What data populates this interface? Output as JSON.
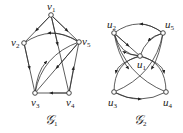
{
  "graphs": [
    {
      "name": "G1",
      "label": "𝒢",
      "label_sub": "1",
      "vertices": [
        {
          "id": "v1",
          "label": "v",
          "sub": "1",
          "x": 51,
          "y": 15
        },
        {
          "id": "v2",
          "label": "v",
          "sub": "2",
          "x": 24,
          "y": 43
        },
        {
          "id": "v5",
          "label": "v",
          "sub": "5",
          "x": 79,
          "y": 42
        },
        {
          "id": "v3",
          "label": "v",
          "sub": "3",
          "x": 35,
          "y": 93
        },
        {
          "id": "v4",
          "label": "v",
          "sub": "4",
          "x": 69,
          "y": 93
        }
      ],
      "edges": [
        {
          "from": "v1",
          "to": "v2"
        },
        {
          "from": "v1",
          "to": "v5"
        },
        {
          "from": "v5",
          "to": "v2"
        },
        {
          "from": "v2",
          "to": "v3"
        },
        {
          "from": "v4",
          "to": "v3"
        },
        {
          "from": "v1",
          "to": "v4"
        },
        {
          "from": "v4",
          "to": "v5"
        },
        {
          "from": "v5",
          "to": "v3"
        },
        {
          "from": "v3",
          "to": "v5"
        }
      ]
    },
    {
      "name": "G2",
      "label": "𝒢",
      "label_sub": "2",
      "vertices": [
        {
          "id": "u2",
          "label": "u",
          "sub": "2",
          "x": 114,
          "y": 33
        },
        {
          "id": "u5",
          "label": "u",
          "sub": "5",
          "x": 163,
          "y": 33
        },
        {
          "id": "u1",
          "label": "u",
          "sub": "1",
          "x": 140,
          "y": 56
        },
        {
          "id": "u3",
          "label": "u",
          "sub": "3",
          "x": 114,
          "y": 92
        },
        {
          "id": "u4",
          "label": "u",
          "sub": "4",
          "x": 166,
          "y": 92
        }
      ],
      "edges": [
        {
          "from": "u5",
          "to": "u2"
        },
        {
          "from": "u1",
          "to": "u2"
        },
        {
          "from": "u2",
          "to": "u1"
        },
        {
          "from": "u5",
          "to": "u1"
        },
        {
          "from": "u3",
          "to": "u4"
        },
        {
          "from": "u1",
          "to": "u3"
        },
        {
          "from": "u1",
          "to": "u4"
        },
        {
          "from": "u2",
          "to": "u4"
        },
        {
          "from": "u5",
          "to": "u3"
        }
      ]
    }
  ]
}
